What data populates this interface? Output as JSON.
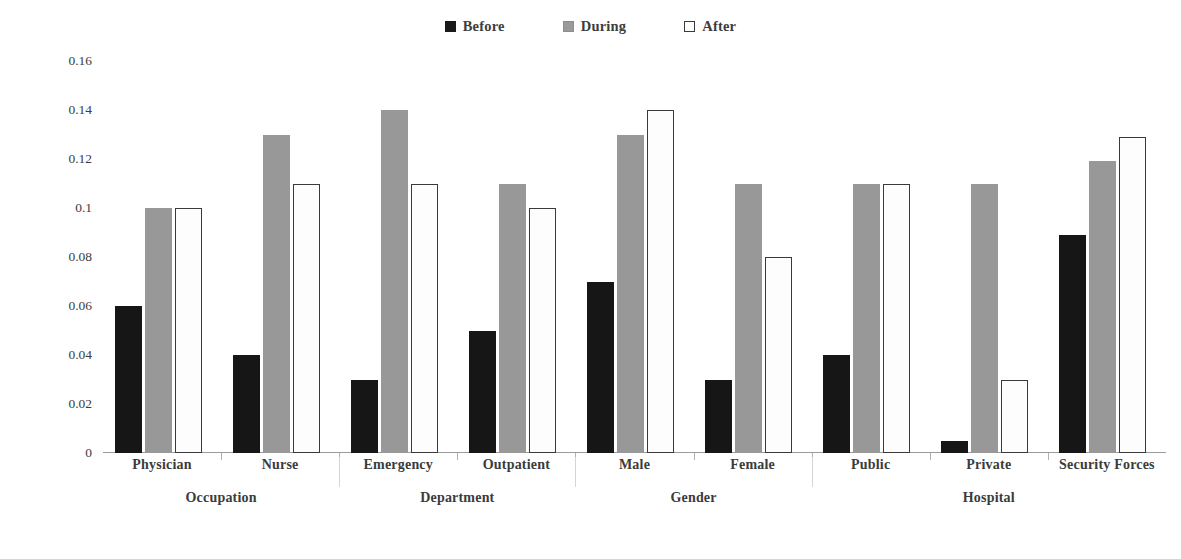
{
  "legend": {
    "position": "top-center",
    "entries": [
      {
        "label": "Before",
        "key": "before",
        "color": "#161616"
      },
      {
        "label": "During",
        "key": "during",
        "color": "#989898"
      },
      {
        "label": "After",
        "key": "after",
        "color": "#ffffff"
      }
    ]
  },
  "axis": {
    "y_title": "Mean of Questionnaire Data",
    "y_ticks": [
      "0",
      "0.02",
      "0.04",
      "0.06",
      "0.08",
      "0.1",
      "0.12",
      "0.14",
      "0.16"
    ]
  },
  "supergroups": [
    {
      "label": "Occupation",
      "span": 2
    },
    {
      "label": "Department",
      "span": 2
    },
    {
      "label": "Gender",
      "span": 2
    },
    {
      "label": "Hospital",
      "span": 3
    }
  ],
  "chart_data": {
    "type": "bar",
    "title": "",
    "xlabel": "",
    "ylabel": "Mean of Questionnaire Data",
    "ylim": [
      0,
      0.16
    ],
    "ytick_step": 0.02,
    "grid": false,
    "legend_position": "top-center",
    "categories": [
      "Physician",
      "Nurse",
      "Emergency",
      "Outpatient",
      "Male",
      "Female",
      "Public",
      "Private",
      "Security Forces"
    ],
    "category_groups": [
      "Occupation",
      "Occupation",
      "Department",
      "Department",
      "Gender",
      "Gender",
      "Hospital",
      "Hospital",
      "Hospital"
    ],
    "series": [
      {
        "name": "Before",
        "color": "#161616",
        "values": [
          0.06,
          0.04,
          0.03,
          0.05,
          0.07,
          0.03,
          0.04,
          0.005,
          0.089
        ]
      },
      {
        "name": "During",
        "color": "#989898",
        "values": [
          0.1,
          0.13,
          0.14,
          0.11,
          0.13,
          0.11,
          0.11,
          0.11,
          0.119
        ]
      },
      {
        "name": "After",
        "color": "#ffffff",
        "values": [
          0.1,
          0.11,
          0.11,
          0.1,
          0.14,
          0.08,
          0.11,
          0.03,
          0.129
        ]
      }
    ]
  }
}
